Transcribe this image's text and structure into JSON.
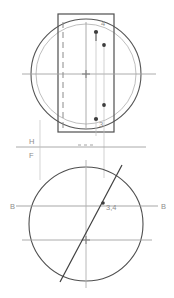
{
  "drawing": {
    "title": "Orthographic projection — cylinder with inclined cutting line",
    "type": "engineering-drawing",
    "canvas": {
      "width": 174,
      "height": 298
    },
    "colors": {
      "object_line": "#4a4a4a",
      "thin_line": "#9a9a9a",
      "center_line": "#a8a8a8",
      "hidden_line": "#8f8f8f",
      "label_text": "#8d8d8d",
      "background": "#ffffff"
    },
    "labels": {
      "point_4": "4",
      "point_3": "3",
      "fold_h": "H",
      "fold_f": "F",
      "aux_left": "B",
      "aux_right": "B",
      "coincident_points": "3,4"
    },
    "top_view": {
      "name": "frontal-view",
      "rectangle": {
        "x": 58,
        "y": 14,
        "width": 56,
        "height": 118
      },
      "circle": {
        "cx": 86,
        "cy": 74,
        "r": 55
      },
      "inner_circle": {
        "cx": 86,
        "cy": 74,
        "r": 50
      },
      "center_mark": {
        "cx": 86,
        "cy": 74
      },
      "hidden_line_x": 63,
      "points": [
        {
          "label": "4",
          "x": 96,
          "y": 32
        },
        {
          "label": "",
          "x": 104,
          "y": 44
        },
        {
          "label": "",
          "x": 104,
          "y": 105
        },
        {
          "label": "3",
          "x": 96,
          "y": 119
        }
      ]
    },
    "bottom_view": {
      "name": "horizontal-view",
      "circle": {
        "cx": 86,
        "cy": 224,
        "r": 57
      },
      "center_vertical_x": 86,
      "center_horizontal_y": 240,
      "aux_line_y": 206,
      "fold_line_y": 160,
      "diagonal": {
        "x1": 60,
        "y1": 280,
        "x2": 120,
        "y2": 167
      },
      "point_34": {
        "x": 103,
        "y": 202
      }
    }
  }
}
